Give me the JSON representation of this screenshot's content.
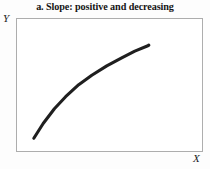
{
  "chart_data": {
    "type": "line",
    "title": "a. Slope: positive and decreasing",
    "xlabel": "X",
    "ylabel": "Y",
    "grid": false,
    "legend": null,
    "axis_ticks": [],
    "xlim": [
      0,
      100
    ],
    "ylim": [
      0,
      100
    ],
    "curve_color": "#1f1f1f",
    "frame_color": "#adadad",
    "background_color": "#ffffff",
    "annotations": [],
    "series": [
      {
        "name": "positive and decreasing slope",
        "shape": "concave-down increasing",
        "x": [
          9,
          14,
          20,
          26,
          33,
          40,
          48,
          56,
          63,
          70,
          70.5
        ],
        "y": [
          11,
          22,
          33,
          42,
          51,
          58,
          65,
          71,
          76,
          80,
          80.5
        ]
      }
    ]
  },
  "labels": {
    "y": "Y",
    "x": "X"
  }
}
